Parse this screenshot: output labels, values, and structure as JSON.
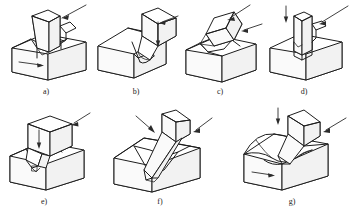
{
  "figure": {
    "background_color": "#ffffff",
    "line_color": "#1d1d1d",
    "panel_count": 7
  },
  "panels": [
    {
      "id": "a",
      "caption": "a)",
      "description": "Vertical rectangular tool cutting a straight shoulder on block; workpiece feed arrow points right along front face",
      "tool_orientation": "vertical",
      "arrows": [
        {
          "name": "cutting-force-arrow",
          "direction": "down-left",
          "style": "thin-line"
        },
        {
          "name": "feed-arrow",
          "direction": "right",
          "style": "thin-line"
        }
      ]
    },
    {
      "id": "b",
      "caption": "b)",
      "description": "Inclined tool with rounded nose forming a groove along the top of the block; vertical arrow on tool face",
      "tool_orientation": "inclined-right",
      "arrows": [
        {
          "name": "cutting-force-arrow",
          "direction": "down",
          "style": "thin-line"
        },
        {
          "name": "feed-arrow",
          "direction": "left",
          "style": "thin-line"
        }
      ]
    },
    {
      "id": "c",
      "caption": "c)",
      "description": "Angled tool cutting a chamfer / bevel at the top edge of the block",
      "tool_orientation": "tilted-left",
      "arrows": [
        {
          "name": "cutting-force-arrow",
          "direction": "down-left",
          "style": "thin-line"
        },
        {
          "name": "feed-arrow",
          "direction": "left",
          "style": "thin-line"
        }
      ]
    },
    {
      "id": "d",
      "caption": "d)",
      "description": "Narrow vertical tool plunging into a slot cut through the top face of the block",
      "tool_orientation": "vertical",
      "arrows": [
        {
          "name": "plunge-arrow",
          "direction": "down",
          "style": "thin-line"
        },
        {
          "name": "cutting-force-arrow",
          "direction": "down-left",
          "style": "thin-line"
        }
      ]
    },
    {
      "id": "e",
      "caption": "e)",
      "description": "Large cubic tool head with small angled cutting insert machining a corner notch; downward arrow on tool face",
      "tool_orientation": "vertical-block",
      "arrows": [
        {
          "name": "plunge-arrow",
          "direction": "down",
          "style": "thin-line"
        },
        {
          "name": "cutting-force-arrow",
          "direction": "down-left",
          "style": "thin-line"
        }
      ]
    },
    {
      "id": "f",
      "caption": "f)",
      "description": "Steeply inclined pointed tool cutting a V-shaped groove across the block",
      "tool_orientation": "inclined-steep",
      "arrows": [
        {
          "name": "cutting-force-arrow-left",
          "direction": "down-right",
          "style": "thin-line"
        },
        {
          "name": "cutting-force-arrow-right",
          "direction": "down-left",
          "style": "thin-line"
        }
      ]
    },
    {
      "id": "g",
      "caption": "g)",
      "description": "Inclined tool cutting a concave curved (radiused) groove in the block; feed arrow points right on front face",
      "tool_orientation": "inclined-right",
      "arrows": [
        {
          "name": "plunge-arrow",
          "direction": "down",
          "style": "thin-line"
        },
        {
          "name": "cutting-force-arrow",
          "direction": "down-left",
          "style": "thin-line"
        },
        {
          "name": "feed-arrow",
          "direction": "right",
          "style": "thin-line"
        }
      ]
    }
  ]
}
